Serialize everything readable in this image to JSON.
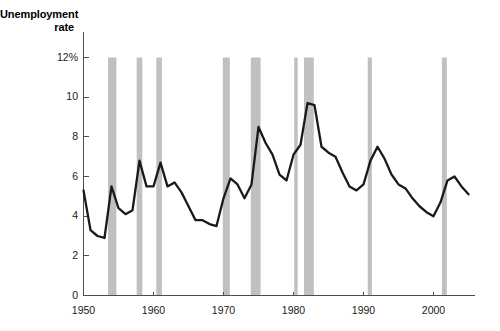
{
  "chart_data": {
    "type": "line",
    "title": "Unemployment\nrate",
    "xlabel": "",
    "ylabel": "",
    "xlim": [
      1950,
      2006
    ],
    "ylim": [
      0,
      12
    ],
    "grid": false,
    "legend": "none",
    "y_ticks": [
      {
        "value": 0,
        "label": "0"
      },
      {
        "value": 2,
        "label": "2"
      },
      {
        "value": 4,
        "label": "4"
      },
      {
        "value": 6,
        "label": "6"
      },
      {
        "value": 8,
        "label": "8"
      },
      {
        "value": 10,
        "label": "10"
      },
      {
        "value": 12,
        "label": "12%"
      }
    ],
    "x_ticks": [
      {
        "value": 1950,
        "label": "1950"
      },
      {
        "value": 1960,
        "label": "1960"
      },
      {
        "value": 1970,
        "label": "1970"
      },
      {
        "value": 1980,
        "label": "1980"
      },
      {
        "value": 1990,
        "label": "1990"
      },
      {
        "value": 2000,
        "label": "2000"
      }
    ],
    "series": [
      {
        "name": "Unemployment rate",
        "color": "#1a1a1a",
        "x": [
          1950,
          1951,
          1952,
          1953,
          1954,
          1955,
          1956,
          1957,
          1958,
          1959,
          1960,
          1961,
          1962,
          1963,
          1964,
          1965,
          1966,
          1967,
          1968,
          1969,
          1970,
          1971,
          1972,
          1973,
          1974,
          1975,
          1976,
          1977,
          1978,
          1979,
          1980,
          1981,
          1982,
          1983,
          1984,
          1985,
          1986,
          1987,
          1988,
          1989,
          1990,
          1991,
          1992,
          1993,
          1994,
          1995,
          1996,
          1997,
          1998,
          1999,
          2000,
          2001,
          2002,
          2003,
          2004,
          2005
        ],
        "values": [
          5.3,
          3.3,
          3.0,
          2.9,
          5.5,
          4.4,
          4.1,
          4.3,
          6.8,
          5.5,
          5.5,
          6.7,
          5.5,
          5.7,
          5.2,
          4.5,
          3.8,
          3.8,
          3.6,
          3.5,
          4.9,
          5.9,
          5.6,
          4.9,
          5.6,
          8.5,
          7.7,
          7.1,
          6.1,
          5.8,
          7.1,
          7.6,
          9.7,
          9.6,
          7.5,
          7.2,
          7.0,
          6.2,
          5.5,
          5.3,
          5.6,
          6.8,
          7.5,
          6.9,
          6.1,
          5.6,
          5.4,
          4.9,
          4.5,
          4.2,
          4.0,
          4.7,
          5.8,
          6.0,
          5.5,
          5.1
        ]
      }
    ],
    "recession_bands": [
      {
        "start": 1953.5,
        "end": 1954.7
      },
      {
        "start": 1957.6,
        "end": 1958.4
      },
      {
        "start": 1960.4,
        "end": 1961.2
      },
      {
        "start": 1969.9,
        "end": 1970.9
      },
      {
        "start": 1973.9,
        "end": 1975.3
      },
      {
        "start": 1980.1,
        "end": 1980.6
      },
      {
        "start": 1981.5,
        "end": 1982.9
      },
      {
        "start": 1990.6,
        "end": 1991.2
      },
      {
        "start": 2001.2,
        "end": 2001.9
      }
    ],
    "recession_band_color": "#c0c0c0",
    "axis_color": "#4d4d4d"
  }
}
